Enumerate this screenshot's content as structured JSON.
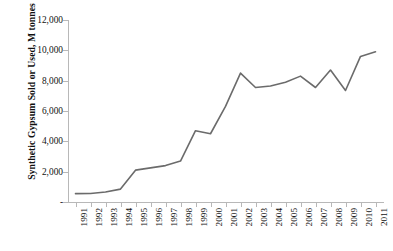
{
  "chart_data": {
    "type": "line",
    "title": "",
    "xlabel": "",
    "ylabel": "Synthetic Gypsum Sold or Used, M tonnes",
    "categories": [
      "1991",
      "1992",
      "1993",
      "1994",
      "1995",
      "1996",
      "1997",
      "1998",
      "1999",
      "2000",
      "2001",
      "2002",
      "2003",
      "2004",
      "2005",
      "2006",
      "2007",
      "2008",
      "2009",
      "2010",
      "2011"
    ],
    "values": [
      550,
      560,
      660,
      850,
      2100,
      2250,
      2400,
      2700,
      4700,
      4500,
      6300,
      8500,
      7550,
      7650,
      7900,
      8300,
      7550,
      8700,
      7350,
      9600,
      9900
    ],
    "series": [
      {
        "name": "Synthetic Gypsum Sold or Used",
        "values": [
          550,
          560,
          660,
          850,
          2100,
          2250,
          2400,
          2700,
          4700,
          4500,
          6300,
          8500,
          7550,
          7650,
          7900,
          8300,
          7550,
          8700,
          7350,
          9600,
          9900
        ]
      }
    ],
    "ylim": [
      0,
      12000
    ],
    "ytick_values": [
      0,
      2000,
      4000,
      6000,
      8000,
      10000,
      12000
    ],
    "ytick_labels": [
      "-",
      "2,000",
      "4,000",
      "6,000",
      "8,000",
      "10,000",
      "12,000"
    ],
    "grid": false,
    "legend": "none",
    "line_color": "#6b6b6b",
    "axis_color": "#b8b8b8",
    "text_color": "#111111"
  }
}
